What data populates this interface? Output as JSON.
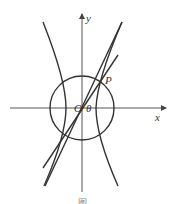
{
  "figure": {
    "labels": {
      "y_axis": "y",
      "x_axis": "x",
      "origin": "O",
      "angle": "θ",
      "point": "P"
    },
    "caption": "图",
    "colors": {
      "stroke": "#333333",
      "axis": "#555555",
      "background": "#ffffff"
    }
  }
}
